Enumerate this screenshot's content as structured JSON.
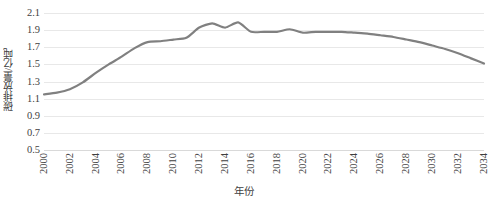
{
  "chart_data": {
    "type": "line",
    "title": "",
    "xlabel": "年份",
    "ylabel": "碳排放量/亿吨",
    "ylim": [
      0.5,
      2.1
    ],
    "ytick_step": 0.2,
    "yticks": [
      "2.1",
      "1.9",
      "1.7",
      "1.5",
      "1.3",
      "1.1",
      "0.9",
      "0.7",
      "0.5"
    ],
    "ytick_values": [
      2.1,
      1.9,
      1.7,
      1.5,
      1.3,
      1.1,
      0.9,
      0.7,
      0.5
    ],
    "xlim": [
      2000,
      2034
    ],
    "xticks": [
      "2000",
      "2002",
      "2004",
      "2006",
      "2008",
      "2010",
      "2012",
      "2014",
      "2016",
      "2018",
      "2020",
      "2022",
      "2024",
      "2026",
      "2028",
      "2030",
      "2032",
      "2034"
    ],
    "xtick_values": [
      2000,
      2002,
      2004,
      2006,
      2008,
      2010,
      2012,
      2014,
      2016,
      2018,
      2020,
      2022,
      2024,
      2026,
      2028,
      2030,
      2032,
      2034
    ],
    "grid": true,
    "grid_axis": "y",
    "legend": false,
    "legend_position": "none",
    "line_color": "#808080",
    "line_width": 2.2,
    "markers": false,
    "x": [
      2000,
      2001,
      2002,
      2003,
      2004,
      2005,
      2006,
      2007,
      2008,
      2009,
      2010,
      2011,
      2012,
      2013,
      2014,
      2015,
      2016,
      2017,
      2018,
      2019,
      2020,
      2021,
      2022,
      2023,
      2024,
      2025,
      2026,
      2027,
      2028,
      2029,
      2030,
      2031,
      2032,
      2033,
      2034
    ],
    "series": [
      {
        "name": "碳排放量",
        "values": [
          1.15,
          1.17,
          1.21,
          1.29,
          1.4,
          1.5,
          1.59,
          1.69,
          1.76,
          1.77,
          1.79,
          1.81,
          1.93,
          1.98,
          1.93,
          1.99,
          1.88,
          1.88,
          1.88,
          1.91,
          1.87,
          1.88,
          1.88,
          1.88,
          1.87,
          1.86,
          1.84,
          1.82,
          1.79,
          1.76,
          1.72,
          1.68,
          1.63,
          1.57,
          1.51
        ]
      }
    ],
    "annotations": []
  },
  "axes": {
    "y_title": "碳排放量/亿吨",
    "x_title": "年份"
  }
}
